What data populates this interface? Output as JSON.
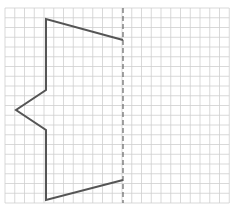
{
  "diagram": {
    "type": "grid-reflection",
    "grid": {
      "x0": 5,
      "y0": 8,
      "cell": 9.75,
      "cols": 23,
      "rows": 20,
      "line_color": "#cfcfcf"
    },
    "mirror_line": {
      "x": 123,
      "y1": 8,
      "y2": 203,
      "color": "#666666",
      "style": "dashed"
    },
    "shape": {
      "color": "#555555",
      "points": [
        [
          123,
          40
        ],
        [
          46,
          19
        ],
        [
          46,
          90
        ],
        [
          16,
          110
        ],
        [
          46,
          130
        ],
        [
          46,
          200
        ],
        [
          123,
          180
        ]
      ]
    }
  }
}
